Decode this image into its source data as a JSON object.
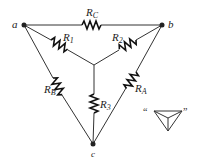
{
  "diagram": {
    "type": "delta-wye resistor network",
    "nodes": [
      {
        "id": "a",
        "label": "a"
      },
      {
        "id": "b",
        "label": "b"
      },
      {
        "id": "c",
        "label": "c"
      }
    ],
    "delta_resistors": [
      {
        "name": "R",
        "sub": "C",
        "between": "a-b"
      },
      {
        "name": "R",
        "sub": "A",
        "between": "b-c"
      },
      {
        "name": "R",
        "sub": "B",
        "between": "a-c"
      }
    ],
    "wye_resistors": [
      {
        "name": "R",
        "sub": "1",
        "between": "a-center"
      },
      {
        "name": "R",
        "sub": "2",
        "between": "b-center"
      },
      {
        "name": "R",
        "sub": "3",
        "between": "c-center"
      }
    ],
    "legend": {
      "open_quote": "“",
      "close_quote": "”",
      "symbol": "triangle-with-wye"
    }
  }
}
